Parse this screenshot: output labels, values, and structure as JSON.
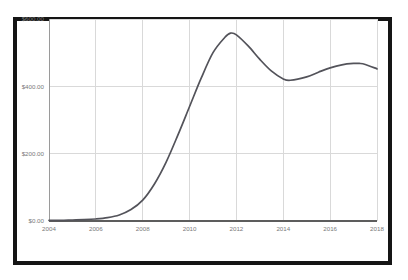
{
  "chart_data": {
    "type": "line",
    "title": "",
    "subtitle": "",
    "xlabel": "",
    "ylabel": "",
    "xlim": [
      2004,
      2018
    ],
    "ylim": [
      0,
      600
    ],
    "grid": true,
    "legend": null,
    "x_ticks": [
      2004,
      2006,
      2008,
      2010,
      2012,
      2014,
      2016,
      2018
    ],
    "x_tick_labels": [
      "2004",
      "2006",
      "2008",
      "2010",
      "2012",
      "2014",
      "2016",
      "2018"
    ],
    "y_ticks": [
      0,
      200,
      400,
      600
    ],
    "y_tick_labels": [
      "$0.00",
      "$200.00",
      "$400.00",
      "$600.00"
    ],
    "series": [
      {
        "name": "value",
        "color": "#53535a",
        "x": [
          2004,
          2004.5,
          2005,
          2005.5,
          2006,
          2006.5,
          2007,
          2007.5,
          2008,
          2008.5,
          2009,
          2009.5,
          2010,
          2010.5,
          2011,
          2011.5,
          2011.75,
          2012,
          2012.5,
          2013,
          2013.5,
          2014,
          2014.3,
          2015,
          2015.5,
          2016,
          2016.5,
          2017,
          2017.25,
          2017.5,
          2018
        ],
        "y": [
          2,
          2,
          3,
          4,
          6,
          10,
          18,
          34,
          62,
          110,
          175,
          255,
          340,
          425,
          500,
          545,
          558,
          553,
          520,
          480,
          445,
          422,
          418,
          428,
          442,
          455,
          464,
          468,
          468,
          465,
          452
        ]
      }
    ]
  },
  "axis_style": {
    "grid_color": "#d9d9d9",
    "axis_color": "#9a9a9a",
    "tick_label_color": "#7a7a7a",
    "frame_color": "#151515",
    "background": "#ffffff"
  }
}
